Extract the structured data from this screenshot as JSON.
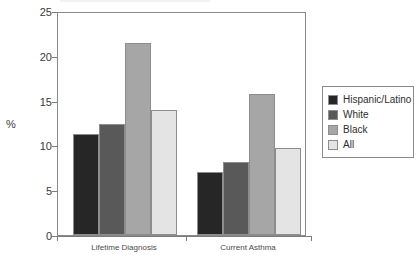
{
  "chart_data": {
    "type": "bar",
    "title": "",
    "xlabel": "",
    "ylabel": "%",
    "ylim": [
      0,
      25
    ],
    "yticks": [
      0,
      5,
      10,
      15,
      20,
      25
    ],
    "ytick_labels": [
      "0",
      "5",
      "10",
      "15",
      "20",
      "25"
    ],
    "grid": false,
    "legend_position": "right",
    "categories": [
      "Lifetime Diagnosis",
      "Current Asthma"
    ],
    "series": [
      {
        "name": "Hispanic/Latino",
        "color": "#262626",
        "values": [
          11.3,
          7.0
        ]
      },
      {
        "name": "White",
        "color": "#595959",
        "values": [
          12.4,
          8.2
        ]
      },
      {
        "name": "Black",
        "color": "#a6a6a6",
        "values": [
          21.4,
          15.7
        ]
      },
      {
        "name": "All",
        "color": "#e4e4e4",
        "values": [
          13.9,
          9.7
        ]
      }
    ]
  },
  "legend": {
    "items": [
      {
        "label": "Hispanic/Latino",
        "color": "#262626"
      },
      {
        "label": "White",
        "color": "#595959"
      },
      {
        "label": "Black",
        "color": "#a6a6a6"
      },
      {
        "label": "All",
        "color": "#e4e4e4"
      }
    ]
  },
  "axes": {
    "y_title": "%"
  },
  "colors": {
    "axis": "#7c7c7c",
    "plot_border": "#8a8a8a",
    "bar_border": "#8d8d8d",
    "text": "#3a3a3a",
    "background": "#ffffff"
  }
}
